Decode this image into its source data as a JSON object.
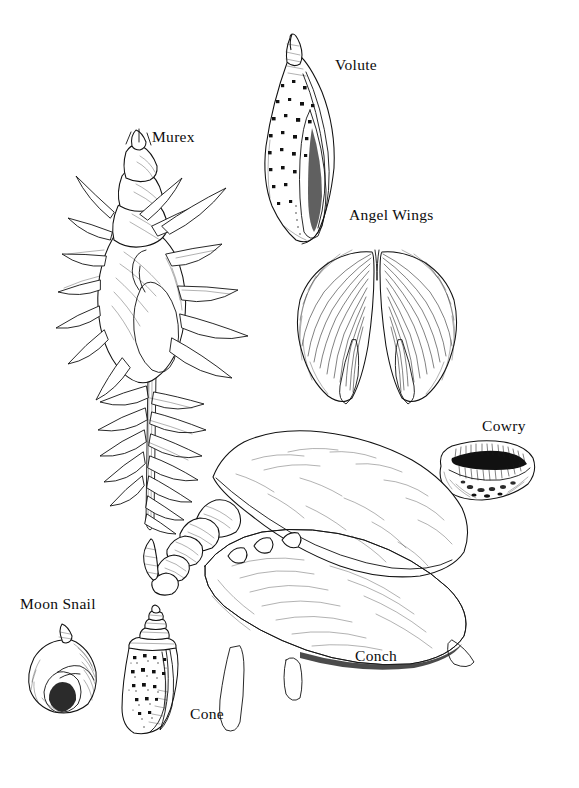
{
  "plate": {
    "title": "Seashell Identification Plate",
    "background_color": "#ffffff",
    "ink_color": "#111111",
    "width": 579,
    "height": 788,
    "style": "pen-and-ink scientific illustration, black line art on white"
  },
  "labels": {
    "murex": "Murex",
    "volute": "Volute",
    "angel_wings": "Angel Wings",
    "cowry": "Cowry",
    "conch": "Conch",
    "moon_snail": "Moon Snail",
    "cone": "Cone"
  },
  "specimens": [
    {
      "name": "Murex",
      "label": "Murex",
      "label_position": {
        "x": 152,
        "y": 129
      },
      "illustration_bounds": {
        "x": 55,
        "y": 145,
        "width": 200,
        "height": 375
      },
      "description": "Tall spiny gastropod with long siphonal canal and three rows of elongated spines"
    },
    {
      "name": "Volute",
      "label": "Volute",
      "label_position": {
        "x": 335,
        "y": 57
      },
      "illustration_bounds": {
        "x": 258,
        "y": 35,
        "width": 78,
        "height": 215
      },
      "description": "Spindle-shaped shell with pointed spire and dark square spots"
    },
    {
      "name": "Angel Wings",
      "label": "Angel Wings",
      "label_position": {
        "x": 349,
        "y": 207
      },
      "illustration_bounds": {
        "x": 295,
        "y": 240,
        "width": 175,
        "height": 170
      },
      "description": "Paired bivalve with radiating ribs spread like butterfly wings"
    },
    {
      "name": "Cowry",
      "label": "Cowry",
      "label_position": {
        "x": 482,
        "y": 418
      },
      "illustration_bounds": {
        "x": 432,
        "y": 440,
        "width": 105,
        "height": 68
      },
      "description": "Oval glossy shell with long toothed slit aperture"
    },
    {
      "name": "Conch",
      "label": "Conch",
      "label_position": {
        "x": 355,
        "y": 648
      },
      "illustration_bounds": {
        "x": 145,
        "y": 430,
        "width": 330,
        "height": 270
      },
      "description": "Large shell with broad flared lip, knobbed spire and dense stippled body whorl"
    },
    {
      "name": "Moon Snail",
      "label": "Moon Snail",
      "label_position": {
        "x": 20,
        "y": 596
      },
      "illustration_bounds": {
        "x": 28,
        "y": 628,
        "width": 70,
        "height": 85
      },
      "description": "Round globular shell with low spire and dark open aperture"
    },
    {
      "name": "Cone",
      "label": "Cone",
      "label_position": {
        "x": 190,
        "y": 706
      },
      "illustration_bounds": {
        "x": 118,
        "y": 615,
        "width": 72,
        "height": 120
      },
      "description": "Inverted conical shell with stepped spire and square dark spots"
    }
  ]
}
